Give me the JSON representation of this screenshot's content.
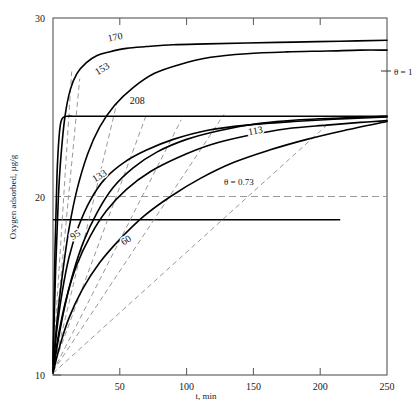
{
  "chart_data": {
    "type": "line",
    "title": "",
    "xlabel": "t, min",
    "ylabel": "Oxygen adsorbed, µg/g",
    "xlim": [
      0,
      250
    ],
    "ylim": [
      10,
      30
    ],
    "xticks": [
      50,
      100,
      150,
      200,
      250
    ],
    "xtick_labels": [
      "50",
      "100",
      "150",
      "200",
      "250"
    ],
    "yticks": [
      10,
      20,
      30
    ],
    "ytick_labels": [
      "10",
      "20",
      "30"
    ],
    "grid": false,
    "legend": "inline curve labels",
    "series": [
      {
        "name": "170",
        "label": "170",
        "label_x": 47,
        "label_y": 28.75,
        "x": [
          0,
          2,
          4,
          6,
          9,
          13,
          18,
          25,
          33,
          42,
          55,
          70,
          90,
          115,
          145,
          180,
          215,
          250
        ],
        "y": [
          10.6,
          16.0,
          19.9,
          22.3,
          24.5,
          26.0,
          26.9,
          27.5,
          27.9,
          28.1,
          28.3,
          28.4,
          28.5,
          28.55,
          28.6,
          28.65,
          28.7,
          28.75
        ]
      },
      {
        "name": "153",
        "label": "153",
        "label_x": 38,
        "label_y": 27.0,
        "x": [
          0,
          3,
          7,
          12,
          18,
          26,
          35,
          46,
          60,
          76,
          95,
          118,
          145,
          175,
          205,
          230,
          250
        ],
        "y": [
          10.3,
          13.0,
          15.6,
          18.2,
          20.4,
          22.4,
          23.9,
          25.1,
          26.1,
          26.9,
          27.4,
          27.8,
          28.0,
          28.1,
          28.15,
          28.2,
          28.2
        ]
      },
      {
        "name": "208",
        "label": "208",
        "label_x": 63,
        "label_y": 25.2,
        "x": [
          0,
          1.5,
          3,
          4.5,
          6,
          8,
          11,
          15,
          22,
          35,
          60,
          100,
          150,
          200,
          250
        ],
        "y": [
          10.8,
          17.0,
          21.2,
          23.3,
          24.2,
          24.45,
          24.5,
          24.5,
          24.5,
          24.5,
          24.5,
          24.5,
          24.5,
          24.5,
          24.5
        ]
      },
      {
        "name": "113",
        "label": "113",
        "label_x": 152,
        "label_y": 23.5,
        "x": [
          0,
          4,
          9,
          15,
          23,
          33,
          45,
          60,
          78,
          100,
          125,
          155,
          185,
          215,
          250
        ],
        "y": [
          10.2,
          12.0,
          13.9,
          15.7,
          17.5,
          19.1,
          20.5,
          21.6,
          22.5,
          23.2,
          23.7,
          24.1,
          24.3,
          24.4,
          24.5
        ]
      },
      {
        "name": "133",
        "label": "133",
        "label_x": 36,
        "label_y": 21.0,
        "x": [
          0,
          3,
          7,
          12,
          19,
          28,
          39,
          53,
          70,
          90,
          115,
          145,
          180,
          215,
          250
        ],
        "y": [
          10.4,
          12.6,
          14.7,
          16.6,
          18.3,
          19.8,
          21.0,
          21.9,
          22.6,
          23.2,
          23.7,
          24.0,
          24.2,
          24.35,
          24.45
        ]
      },
      {
        "name": "95",
        "label": "95",
        "label_x": 18,
        "label_y": 17.7,
        "x": [
          0,
          4,
          10,
          18,
          28,
          40,
          55,
          73,
          94,
          118,
          145,
          175,
          205,
          230,
          250
        ],
        "y": [
          10.2,
          12.2,
          14.3,
          16.2,
          17.8,
          19.2,
          20.4,
          21.4,
          22.2,
          22.9,
          23.4,
          23.8,
          24.0,
          24.15,
          24.25
        ]
      },
      {
        "name": "60",
        "label": "60",
        "label_x": 56,
        "label_y": 17.4,
        "x": [
          0,
          5,
          12,
          22,
          35,
          50,
          68,
          88,
          110,
          135,
          162,
          190,
          218,
          250
        ],
        "y": [
          10.1,
          11.6,
          13.2,
          14.8,
          16.3,
          17.6,
          18.9,
          20.0,
          21.0,
          21.9,
          22.6,
          23.2,
          23.7,
          24.2
        ]
      }
    ],
    "tangents": [
      {
        "name": "tangent-170",
        "x1": 0,
        "y1": 10.6,
        "x2": 14,
        "y2": 27.0
      },
      {
        "name": "tangent-208",
        "x1": 0,
        "y1": 10.8,
        "x2": 20,
        "y2": 26.6
      },
      {
        "name": "tangent-153",
        "x1": 0,
        "y1": 10.3,
        "x2": 48,
        "y2": 25.3
      },
      {
        "name": "tangent-133",
        "x1": 0,
        "y1": 10.4,
        "x2": 70,
        "y2": 24.6
      },
      {
        "name": "tangent-95",
        "x1": 0,
        "y1": 10.2,
        "x2": 96,
        "y2": 24.3
      },
      {
        "name": "tangent-113",
        "x1": 0,
        "y1": 10.2,
        "x2": 128,
        "y2": 24.6
      },
      {
        "name": "tangent-60",
        "x1": 0,
        "y1": 10.1,
        "x2": 205,
        "y2": 24.0
      }
    ],
    "reference_lines": [
      {
        "name": "theta-1-level",
        "label": "θ = 1",
        "y": 24.5,
        "style": "none"
      },
      {
        "name": "theta-073-line",
        "label": "θ = 0.73",
        "y": 18.7,
        "style": "solid",
        "x_from": 0,
        "x_to": 215
      },
      {
        "name": "dashed-20-line",
        "label": "",
        "y": 20.0,
        "style": "dashed",
        "x_from": 0,
        "x_to": 250
      }
    ],
    "annotations": [
      {
        "name": "theta-1",
        "text": "θ = 1",
        "x_px": 391,
        "y_px": 71
      },
      {
        "name": "theta-073",
        "text": "θ = 0.73",
        "x_px": 222,
        "y_px": 181
      }
    ],
    "colors": {
      "curve": "#000000",
      "tangent": "#8c8c8c",
      "axis": "#555555",
      "dashed": "#9a9a9a"
    }
  }
}
